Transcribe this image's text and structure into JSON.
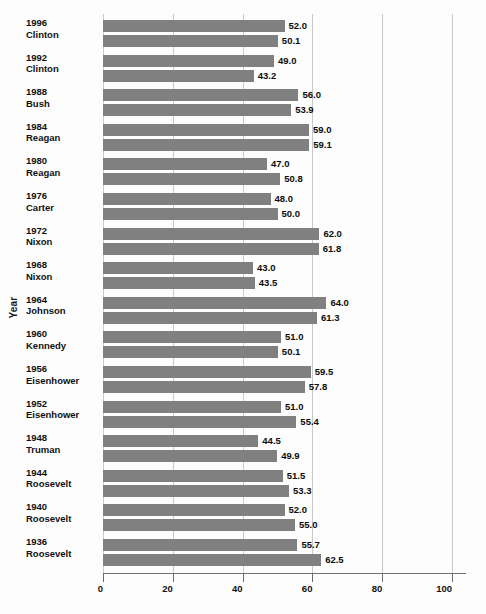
{
  "chart_data": {
    "type": "bar",
    "orientation": "horizontal",
    "title": "",
    "xlabel": "",
    "ylabel": "Year",
    "xlim": [
      0,
      104
    ],
    "xticks": [
      0,
      20,
      40,
      60,
      80,
      100
    ],
    "xtick_labels": [
      "0",
      "20",
      "40",
      "60",
      "80",
      "100"
    ],
    "grid": true,
    "grid_axis": "x",
    "legend": false,
    "bar_color": "#808080",
    "value_label_format": "one-decimal",
    "categories": [
      "1996 Clinton",
      "1992 Clinton",
      "1988 Bush",
      "1984 Reagan",
      "1980 Reagan",
      "1976 Carter",
      "1972 Nixon",
      "1968 Nixon",
      "1964 Johnson",
      "1960 Kennedy",
      "1956 Eisenhower",
      "1952 Eisenhower",
      "1948 Truman",
      "1944 Roosevelt",
      "1940 Roosevelt",
      "1936 Roosevelt"
    ],
    "series": [
      {
        "name": "upper",
        "values": [
          52.0,
          49.0,
          56.0,
          59.0,
          47.0,
          48.0,
          62.0,
          43.0,
          64.0,
          51.0,
          59.5,
          51.0,
          44.5,
          51.5,
          52.0,
          55.7
        ]
      },
      {
        "name": "lower",
        "values": [
          50.1,
          43.2,
          53.9,
          59.1,
          50.8,
          50.0,
          61.8,
          43.5,
          61.3,
          50.1,
          57.8,
          55.4,
          49.9,
          53.3,
          55.0,
          62.5
        ]
      }
    ]
  },
  "groups": [
    {
      "year": "1996",
      "president": "Clinton",
      "values": [
        52.0,
        50.1
      ],
      "labels": [
        "52.0",
        "50.1"
      ]
    },
    {
      "year": "1992",
      "president": "Clinton",
      "values": [
        49.0,
        43.2
      ],
      "labels": [
        "49.0",
        "43.2"
      ]
    },
    {
      "year": "1988",
      "president": "Bush",
      "values": [
        56.0,
        53.9
      ],
      "labels": [
        "56.0",
        "53.9"
      ]
    },
    {
      "year": "1984",
      "president": "Reagan",
      "values": [
        59.0,
        59.1
      ],
      "labels": [
        "59.0",
        "59.1"
      ]
    },
    {
      "year": "1980",
      "president": "Reagan",
      "values": [
        47.0,
        50.8
      ],
      "labels": [
        "47.0",
        "50.8"
      ]
    },
    {
      "year": "1976",
      "president": "Carter",
      "values": [
        48.0,
        50.0
      ],
      "labels": [
        "48.0",
        "50.0"
      ]
    },
    {
      "year": "1972",
      "president": "Nixon",
      "values": [
        62.0,
        61.8
      ],
      "labels": [
        "62.0",
        "61.8"
      ]
    },
    {
      "year": "1968",
      "president": "Nixon",
      "values": [
        43.0,
        43.5
      ],
      "labels": [
        "43.0",
        "43.5"
      ]
    },
    {
      "year": "1964",
      "president": "Johnson",
      "values": [
        64.0,
        61.3
      ],
      "labels": [
        "64.0",
        "61.3"
      ]
    },
    {
      "year": "1960",
      "president": "Kennedy",
      "values": [
        51.0,
        50.1
      ],
      "labels": [
        "51.0",
        "50.1"
      ]
    },
    {
      "year": "1956",
      "president": "Eisenhower",
      "values": [
        59.5,
        57.8
      ],
      "labels": [
        "59.5",
        "57.8"
      ]
    },
    {
      "year": "1952",
      "president": "Eisenhower",
      "values": [
        51.0,
        55.4
      ],
      "labels": [
        "51.0",
        "55.4"
      ]
    },
    {
      "year": "1948",
      "president": "Truman",
      "values": [
        44.5,
        49.9
      ],
      "labels": [
        "44.5",
        "49.9"
      ]
    },
    {
      "year": "1944",
      "president": "Roosevelt",
      "values": [
        51.5,
        53.3
      ],
      "labels": [
        "51.5",
        "53.3"
      ]
    },
    {
      "year": "1940",
      "president": "Roosevelt",
      "values": [
        52.0,
        55.0
      ],
      "labels": [
        "52.0",
        "55.0"
      ]
    },
    {
      "year": "1936",
      "president": "Roosevelt",
      "values": [
        55.7,
        62.5
      ],
      "labels": [
        "55.7",
        "62.5"
      ]
    }
  ],
  "axis": {
    "y_title": "Year",
    "x_ticks": [
      "0",
      "20",
      "40",
      "60",
      "80",
      "100"
    ]
  },
  "layout": {
    "plot_left": 103,
    "plot_top": 14,
    "plot_width": 363,
    "plot_height": 559,
    "units_per_px": 0.2762,
    "px_per_unit": 3.62,
    "bar_height": 12,
    "bar_gap": 3,
    "group_gap": 10,
    "group_pitch": 34.6,
    "first_bar_top": 20
  }
}
